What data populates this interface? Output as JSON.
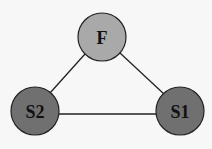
{
  "diagram": {
    "type": "graph",
    "nodes": [
      {
        "id": "F",
        "label": "F",
        "cx": 102,
        "cy": 37,
        "r": 24,
        "fill": "#a9a9a9"
      },
      {
        "id": "S2",
        "label": "S2",
        "cx": 35,
        "cy": 111,
        "r": 24,
        "fill": "#707070"
      },
      {
        "id": "S1",
        "label": "S1",
        "cx": 180,
        "cy": 111,
        "r": 24,
        "fill": "#707070"
      }
    ],
    "edges": [
      {
        "from": "F",
        "to": "S2"
      },
      {
        "from": "F",
        "to": "S1"
      },
      {
        "from": "S2",
        "to": "S1"
      }
    ]
  }
}
